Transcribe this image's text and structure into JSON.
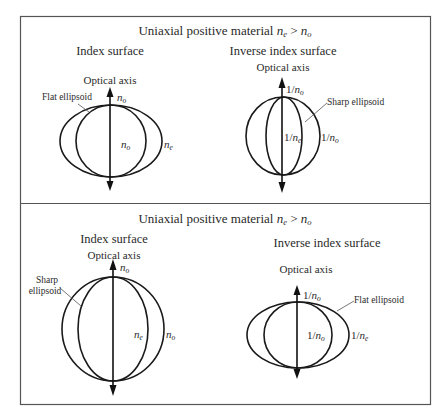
{
  "panels": [
    {
      "title_prefix": "Uniaxial positive material ",
      "title_rel_a": "n",
      "title_rel_a_sub": "e",
      "title_rel_op": " > ",
      "title_rel_b": "n",
      "title_rel_b_sub": "o",
      "left": {
        "heading": "Index surface",
        "axis_label": "Optical axis",
        "callout": [
          "Flat ellipsoid"
        ],
        "label_top": {
          "base": "n",
          "sub": "o"
        },
        "label_inner": {
          "base": "n",
          "sub": "o"
        },
        "label_outer": {
          "base": "n",
          "sub": "e"
        }
      },
      "right": {
        "heading": "Inverse index surface",
        "axis_label": "Optical axis",
        "callout": [
          "Sharp ellipsoid"
        ],
        "label_top": {
          "pre": "1/",
          "base": "n",
          "sub": "o"
        },
        "label_inner": {
          "pre": "1/",
          "base": "n",
          "sub": "e"
        },
        "label_outer": {
          "pre": "1/",
          "base": "n",
          "sub": "o"
        }
      }
    },
    {
      "title_prefix": "Uniaxial positive material ",
      "title_rel_a": "n",
      "title_rel_a_sub": "e",
      "title_rel_op": " > ",
      "title_rel_b": "n",
      "title_rel_b_sub": "o",
      "left": {
        "heading": "Index surface",
        "axis_label": "Optical axis",
        "callout": [
          "Sharp",
          "ellipsoid"
        ],
        "label_top": {
          "base": "n",
          "sub": "o"
        },
        "label_inner": {
          "base": "n",
          "sub": "e"
        },
        "label_outer": {
          "base": "n",
          "sub": "o"
        }
      },
      "right": {
        "heading": "Inverse index surface",
        "axis_label": "Optical axis",
        "callout": [
          "Flat ellipsoid"
        ],
        "label_top": {
          "pre": "1/",
          "base": "n",
          "sub": "o"
        },
        "label_inner": {
          "pre": "1/",
          "base": "n",
          "sub": "o"
        },
        "label_outer": {
          "pre": "1/",
          "base": "n",
          "sub": "e"
        }
      }
    }
  ]
}
